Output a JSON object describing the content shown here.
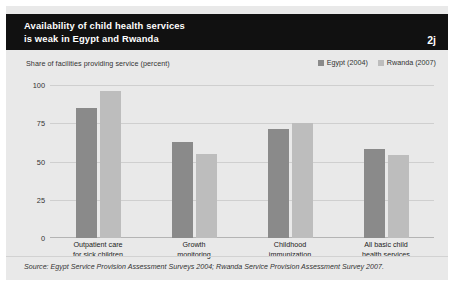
{
  "header": {
    "title_line1": "Availability of child health services",
    "title_line2": "is weak in Egypt and Rwanda",
    "figure_number": "2j",
    "background_color": "#111111",
    "text_color": "#ffffff"
  },
  "panel": {
    "background_color": "#e9e9e9"
  },
  "source": {
    "text": "Source: Egypt Service Provision Assessment Surveys 2004; Rwanda Service Provision Assessment Survey 2007."
  },
  "chart_data": {
    "type": "bar",
    "title": "Availability of child health services is weak in Egypt and Rwanda",
    "subtitle": "",
    "ylabel": "Share of facilities providing service (percent)",
    "xlabel": "",
    "ylim": [
      0,
      100
    ],
    "yticks": [
      0,
      25,
      50,
      75,
      100
    ],
    "ytick_labels": [
      "0",
      "25",
      "50",
      "75",
      "100"
    ],
    "grid": true,
    "legend_position": "top-right",
    "categories": [
      "Outpatient care for sick children",
      "Growth monitoring",
      "Childhood immunization",
      "All basic child health services"
    ],
    "category_lines": [
      [
        "Outpatient care",
        "for sick children"
      ],
      [
        "Growth",
        "monitoring"
      ],
      [
        "Childhood",
        "immunization"
      ],
      [
        "All basic child",
        "health services"
      ]
    ],
    "series": [
      {
        "name": "Egypt (2004)",
        "color": "#8a8a8a",
        "values": [
          85,
          63,
          71,
          58
        ]
      },
      {
        "name": "Rwanda (2007)",
        "color": "#bdbdbd",
        "values": [
          96,
          55,
          75,
          54
        ]
      }
    ]
  }
}
